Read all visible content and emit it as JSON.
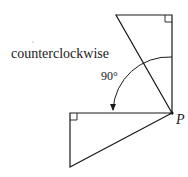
{
  "diagram": {
    "direction_label": "counterclockwise",
    "angle_label": "90°",
    "point_label": "P",
    "colors": {
      "stroke": "#1a1a1a",
      "background": "#ffffff"
    },
    "shapes": [
      {
        "name": "original-triangle",
        "type": "right-triangle",
        "points": [
          [
            116,
            15
          ],
          [
            172,
            15
          ],
          [
            172,
            113
          ]
        ],
        "right_angle_at": [
          172,
          15
        ]
      },
      {
        "name": "rotated-triangle",
        "type": "right-triangle",
        "points": [
          [
            70,
            113
          ],
          [
            172,
            113
          ],
          [
            70,
            167
          ]
        ],
        "right_angle_at": [
          70,
          113
        ]
      }
    ],
    "rotation": {
      "center": "P",
      "angle_deg": 90,
      "direction": "counterclockwise"
    }
  }
}
